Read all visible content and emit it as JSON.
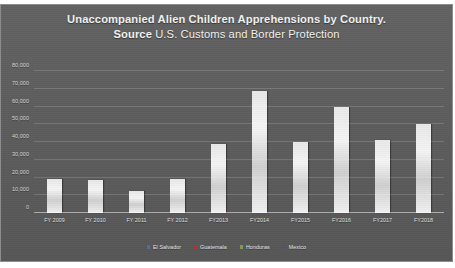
{
  "chart_data": {
    "type": "bar",
    "title": "Unaccompanied Alien Children Apprehensions by Country.",
    "subtitle_bold": "Source",
    "subtitle_rest": " U.S. Customs and Border Protection",
    "xlabel": "",
    "ylabel": "",
    "categories": [
      "FY 2009",
      "FY 2010",
      "FY 2011",
      "FY 2012",
      "FY2013",
      "FY2014",
      "FY2015",
      "FY2016",
      "FY2017",
      "FY2018"
    ],
    "values": [
      19000,
      18400,
      12500,
      19000,
      38800,
      68500,
      39900,
      59700,
      41400,
      50000
    ],
    "ylim": [
      0,
      80000
    ],
    "yticks": [
      0,
      10000,
      20000,
      30000,
      40000,
      50000,
      60000,
      70000,
      80000
    ],
    "ytick_labels": [
      "0",
      "10,000",
      "20,000",
      "30,000",
      "40,000",
      "50,000",
      "60,000",
      "70,000",
      "80,000"
    ],
    "grid": true,
    "legend_position": "bottom",
    "legend": [
      {
        "label": "El Salvador",
        "color": "#4a6fa5"
      },
      {
        "label": "Guatemala",
        "color": "#9e3a3a"
      },
      {
        "label": "Honduras",
        "color": "#7f9b55"
      },
      {
        "label": "Mexico",
        "color": "#5d4a7d"
      }
    ],
    "bar_color": "#ededed",
    "plot_background": "#5b5b5b"
  }
}
